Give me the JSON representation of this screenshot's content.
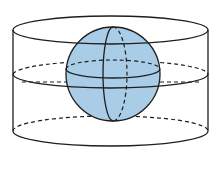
{
  "figure": {
    "colors": {
      "line": "#1e1e1e",
      "sphere_fill": "#a9cde6",
      "background": "#ffffff"
    },
    "cylinder": {
      "left_x": 13,
      "right_x": 208,
      "top_ellipse": {
        "cx": 110.5,
        "cy": 30,
        "rx": 97.5,
        "ry": 14
      },
      "middle_ellipse": {
        "cx": 110.5,
        "cy": 74,
        "rx": 97.5,
        "ry": 14
      },
      "bottom_ellipse": {
        "cx": 110.5,
        "cy": 131,
        "rx": 97.5,
        "ry": 15
      }
    },
    "sphere": {
      "cx": 113,
      "cy": 74,
      "r": 47
    }
  }
}
